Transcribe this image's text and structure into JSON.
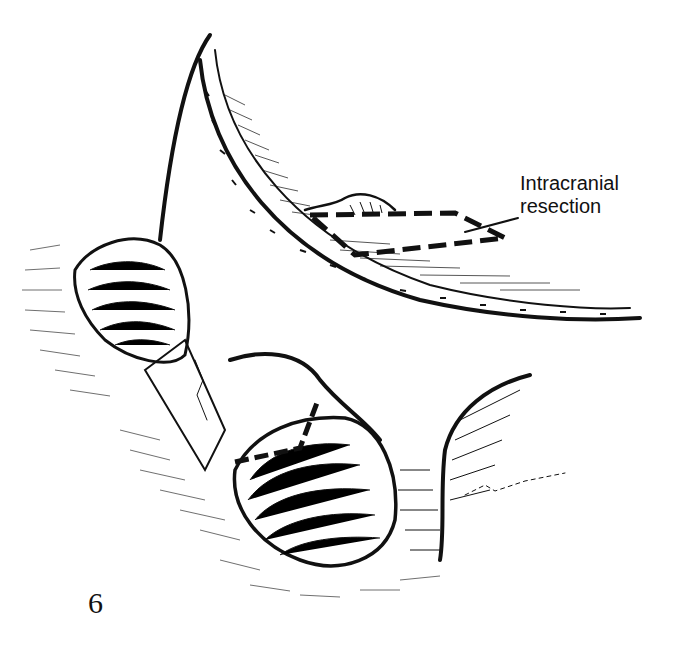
{
  "figure": {
    "number": "6",
    "annotation": {
      "line1": "Intracranial",
      "line2": "resection"
    },
    "signature": "R.O.",
    "colors": {
      "ink": "#111111",
      "background": "#ffffff"
    }
  }
}
